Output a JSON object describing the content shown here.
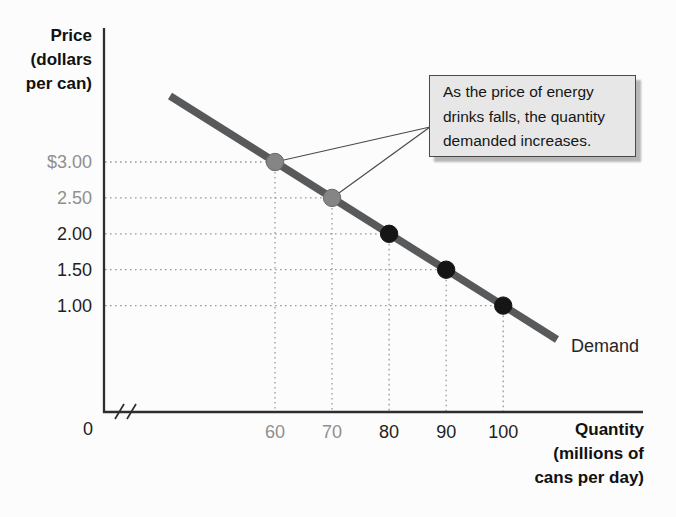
{
  "colors": {
    "demand_line": "#58595b",
    "highlight_point_fill": "#858585",
    "highlight_point_stroke": "#6a6a6a",
    "black_point_fill": "#151515",
    "gray_tick_label": "#8f8f8f",
    "black_tick_label": "#1f1f1f",
    "axis": "#2e2e2e",
    "guide_dotted": "#999999",
    "callout_line": "#4a4a4a",
    "annotation_bg": "#e7e7e7",
    "annotation_border": "#4a4a4a",
    "page_bg": "#fcfcfc"
  },
  "y_axis": {
    "title_lines": [
      "Price",
      "(dollars",
      "per can)"
    ]
  },
  "x_axis": {
    "title_lines": [
      "Quantity",
      "(millions of",
      "cans per day)"
    ],
    "origin_label": "0"
  },
  "series_label": "Demand",
  "annotation": {
    "lines": [
      "As the price of energy",
      "drinks falls, the quantity",
      "demanded increases."
    ]
  },
  "chart_data": {
    "type": "line",
    "xlabel": "Quantity (millions of cans per day)",
    "ylabel": "Price (dollars per can)",
    "series": [
      {
        "name": "Demand",
        "x": [
          60,
          70,
          80,
          90,
          100
        ],
        "y": [
          3.0,
          2.5,
          2.0,
          1.5,
          1.0
        ],
        "point_emphasis": [
          "gray",
          "gray",
          "black",
          "black",
          "black"
        ]
      }
    ],
    "x_ticks": [
      {
        "label": "60",
        "value": 60,
        "color": "gray"
      },
      {
        "label": "70",
        "value": 70,
        "color": "gray"
      },
      {
        "label": "80",
        "value": 80,
        "color": "black"
      },
      {
        "label": "90",
        "value": 90,
        "color": "black"
      },
      {
        "label": "100",
        "value": 100,
        "color": "black"
      }
    ],
    "y_ticks": [
      {
        "label": "$3.00",
        "value": 3.0,
        "color": "gray"
      },
      {
        "label": "2.50",
        "value": 2.5,
        "color": "gray"
      },
      {
        "label": "2.00",
        "value": 2.0,
        "color": "black"
      },
      {
        "label": "1.50",
        "value": 1.5,
        "color": "black"
      },
      {
        "label": "1.00",
        "value": 1.0,
        "color": "black"
      }
    ],
    "origin_label": "0",
    "axis_break_on_x": true,
    "grid": "dotted guide lines from each data point to both axes",
    "legend": "inline label 'Demand' at lower end of line",
    "annotations": [
      {
        "text": "As the price of energy drinks falls, the quantity demanded increases.",
        "targets_xy": [
          [
            60,
            3.0
          ],
          [
            70,
            2.5
          ]
        ]
      }
    ]
  }
}
